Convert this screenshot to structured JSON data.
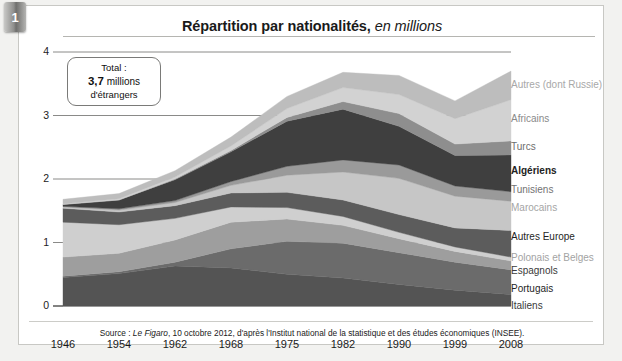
{
  "tab": {
    "number": "1"
  },
  "title": {
    "main": "Répartition par nationalités,",
    "emphasis": " en millions"
  },
  "callout": {
    "line1": "Total :",
    "line2_bold": "3,7",
    "line2_rest": " millions",
    "line3": "d'étrangers"
  },
  "source": {
    "prefix": "Source : ",
    "italic": "Le Figaro",
    "rest": ", 10 octobre 2012, d'après l'Institut national de la statistique et des études économiques (INSEE)."
  },
  "axes": {
    "y_ticks": [
      "0",
      "1",
      "2",
      "3",
      "4"
    ],
    "x_ticks": [
      "1946",
      "1954",
      "1962",
      "1968",
      "1975",
      "1982",
      "1990",
      "1999",
      "2008"
    ],
    "ylabel": "",
    "xlabel": "",
    "ylim": [
      0,
      4
    ]
  },
  "legend": [
    {
      "label": "Autres (dont Russie)",
      "color": "#bdbdbd",
      "weight": "normal",
      "text_color": "#a8a8a8",
      "y": 79
    },
    {
      "label": "Africains",
      "color": "#d2d2d2",
      "weight": "normal",
      "text_color": "#8a8a8a",
      "y": 113
    },
    {
      "label": "Turcs",
      "color": "#8e8e8e",
      "weight": "normal",
      "text_color": "#6e6e6e",
      "y": 141
    },
    {
      "label": "Algériens",
      "color": "#3f3f3f",
      "weight": "bold",
      "text_color": "#222222",
      "y": 165
    },
    {
      "label": "Tunisiens",
      "color": "#9a9a9a",
      "weight": "normal",
      "text_color": "#737373",
      "y": 184
    },
    {
      "label": "Marocains",
      "color": "#c6c6c6",
      "weight": "normal",
      "text_color": "#a5a5a5",
      "y": 202
    },
    {
      "label": "Autres Europe",
      "color": "#5c5c5c",
      "weight": "normal",
      "text_color": "#1f1f1f",
      "y": 231
    },
    {
      "label": "Polonais et Belges",
      "color": "#cfcfcf",
      "weight": "normal",
      "text_color": "#a3a3a3",
      "y": 252
    },
    {
      "label": "Espagnols",
      "color": "#9e9e9e",
      "weight": "normal",
      "text_color": "#3a3a3a",
      "y": 265
    },
    {
      "label": "Portugais",
      "color": "#6b6b6b",
      "weight": "normal",
      "text_color": "#1f1f1f",
      "y": 283
    },
    {
      "label": "Italiens",
      "color": "#545454",
      "weight": "normal",
      "text_color": "#3a3a3a",
      "y": 300
    }
  ],
  "chart_data": {
    "type": "area",
    "title": "Répartition par nationalités, en millions",
    "xlabel": "",
    "ylabel": "millions",
    "ylim": [
      0,
      4
    ],
    "grid": true,
    "legend_position": "right",
    "stacked": true,
    "annotation": "Total : 3,7 millions d'étrangers",
    "x": [
      "1946",
      "1954",
      "1962",
      "1968",
      "1975",
      "1982",
      "1990",
      "1999",
      "2008"
    ],
    "series": [
      {
        "name": "Italiens",
        "color": "#545454",
        "values": [
          0.45,
          0.51,
          0.63,
          0.6,
          0.5,
          0.44,
          0.34,
          0.25,
          0.18
        ]
      },
      {
        "name": "Portugais",
        "color": "#6b6b6b",
        "values": [
          0.02,
          0.03,
          0.06,
          0.3,
          0.52,
          0.55,
          0.5,
          0.44,
          0.39
        ]
      },
      {
        "name": "Espagnols",
        "color": "#9e9e9e",
        "values": [
          0.3,
          0.29,
          0.35,
          0.42,
          0.35,
          0.28,
          0.22,
          0.17,
          0.14
        ]
      },
      {
        "name": "Polonais et Belges",
        "color": "#cfcfcf",
        "values": [
          0.55,
          0.45,
          0.34,
          0.24,
          0.18,
          0.14,
          0.1,
          0.07,
          0.06
        ]
      },
      {
        "name": "Autres Europe",
        "color": "#5c5c5c",
        "values": [
          0.22,
          0.2,
          0.2,
          0.22,
          0.24,
          0.26,
          0.28,
          0.3,
          0.42
        ]
      },
      {
        "name": "Marocains",
        "color": "#c6c6c6",
        "values": [
          0.02,
          0.03,
          0.05,
          0.12,
          0.27,
          0.44,
          0.57,
          0.5,
          0.46
        ]
      },
      {
        "name": "Tunisiens",
        "color": "#9a9a9a",
        "values": [
          0.01,
          0.02,
          0.03,
          0.06,
          0.14,
          0.19,
          0.21,
          0.16,
          0.15
        ]
      },
      {
        "name": "Algériens",
        "color": "#3f3f3f",
        "values": [
          0.03,
          0.14,
          0.33,
          0.47,
          0.71,
          0.8,
          0.61,
          0.48,
          0.58
        ]
      },
      {
        "name": "Turcs",
        "color": "#8e8e8e",
        "values": [
          0.0,
          0.0,
          0.01,
          0.02,
          0.06,
          0.12,
          0.2,
          0.18,
          0.22
        ]
      },
      {
        "name": "Africains",
        "color": "#d2d2d2",
        "values": [
          0.01,
          0.02,
          0.03,
          0.07,
          0.14,
          0.22,
          0.3,
          0.4,
          0.65
        ]
      },
      {
        "name": "Autres (dont Russie)",
        "color": "#bdbdbd",
        "values": [
          0.07,
          0.08,
          0.1,
          0.14,
          0.19,
          0.24,
          0.3,
          0.28,
          0.45
        ]
      }
    ]
  }
}
